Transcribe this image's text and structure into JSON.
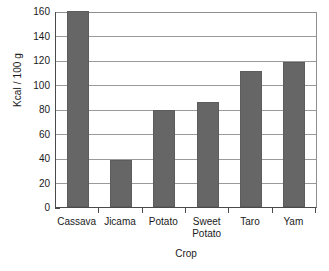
{
  "chart_data": {
    "type": "bar",
    "title": "",
    "xlabel": "Crop",
    "ylabel": "Kcal / 100 g",
    "categories": [
      "Cassava",
      "Jicama",
      "Potato",
      "Sweet\nPotato",
      "Taro",
      "Yam"
    ],
    "values": [
      160,
      38,
      79,
      86,
      111,
      118
    ],
    "ylim": [
      0,
      160
    ],
    "ytick_labels": [
      "0",
      "20",
      "40",
      "60",
      "80",
      "100",
      "120",
      "140",
      "160"
    ],
    "ytick_values": [
      0,
      20,
      40,
      60,
      80,
      100,
      120,
      140,
      160
    ],
    "grid": true,
    "grid_axis": "y",
    "legend": "none",
    "bar_color": "#666666",
    "grid_color": "#9a9a9a",
    "axis_color": "#4a4a4a",
    "background_color": "#ffffff"
  }
}
